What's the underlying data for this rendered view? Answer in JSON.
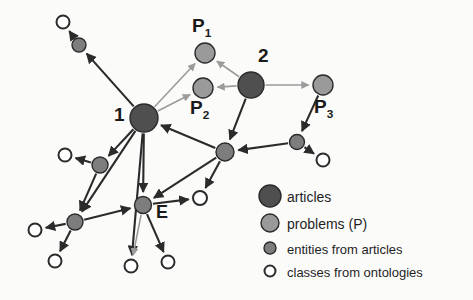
{
  "figure": {
    "type": "node-link-diagram",
    "background_color": "#fbfbfa",
    "edge_color_dark": "#2b2b2b",
    "edge_color_light": "#9b9b9b"
  },
  "palette": {
    "articles": "#4f4f4f",
    "problems": "#9a9a9a",
    "entities": "#7d7d7d",
    "classes": "#ffffff",
    "stroke": "#2b2b2b",
    "text": "#1a1a1a"
  },
  "labels": {
    "node1": "1",
    "node2": "2",
    "p1_base": "P",
    "p1_sub": "1",
    "p2_base": "P",
    "p2_sub": "2",
    "p3_base": "P",
    "p3_sub": "3",
    "entity_e": "E"
  },
  "legend": {
    "items": [
      {
        "label": "articles",
        "kind": "articles",
        "color": "#4f4f4f",
        "radius": 11
      },
      {
        "label": "problems (P)",
        "kind": "problems",
        "color": "#9a9a9a",
        "radius": 9
      },
      {
        "label": "entities from articles",
        "kind": "entities",
        "color": "#7d7d7d",
        "radius": 6
      },
      {
        "label": "classes from ontologies",
        "kind": "classes",
        "color": "#ffffff",
        "radius": 5.5
      }
    ]
  },
  "chart_data": {
    "type": "diagram",
    "title": "",
    "nodes": [
      {
        "id": "c1",
        "kind": "classes",
        "x": 63,
        "y": 22,
        "r": 6.5,
        "label": ""
      },
      {
        "id": "e1",
        "kind": "entities",
        "x": 79,
        "y": 45,
        "r": 7,
        "label": ""
      },
      {
        "id": "a1",
        "kind": "articles",
        "x": 144,
        "y": 118,
        "r": 14,
        "label": "1"
      },
      {
        "id": "p1",
        "kind": "problems",
        "x": 205,
        "y": 53,
        "r": 10,
        "label": "P1"
      },
      {
        "id": "p2",
        "kind": "problems",
        "x": 203,
        "y": 88,
        "r": 10,
        "label": "P2"
      },
      {
        "id": "a2",
        "kind": "articles",
        "x": 251,
        "y": 85,
        "r": 13,
        "label": "2"
      },
      {
        "id": "p3",
        "kind": "problems",
        "x": 323,
        "y": 85,
        "r": 10,
        "label": "P3"
      },
      {
        "id": "e2",
        "kind": "entities",
        "x": 297,
        "y": 142,
        "r": 7.5,
        "label": ""
      },
      {
        "id": "c2",
        "kind": "classes",
        "x": 323,
        "y": 160,
        "r": 6.5,
        "label": ""
      },
      {
        "id": "h1",
        "kind": "entities",
        "x": 225,
        "y": 152,
        "r": 9,
        "label": ""
      },
      {
        "id": "c3",
        "kind": "classes",
        "x": 200,
        "y": 198,
        "r": 7,
        "label": ""
      },
      {
        "id": "e3",
        "kind": "entities",
        "x": 100,
        "y": 165,
        "r": 8,
        "label": ""
      },
      {
        "id": "c4",
        "kind": "classes",
        "x": 65,
        "y": 155,
        "r": 6.5,
        "label": ""
      },
      {
        "id": "eE",
        "kind": "entities",
        "x": 143,
        "y": 205,
        "r": 8.5,
        "label": "E"
      },
      {
        "id": "e4",
        "kind": "entities",
        "x": 75,
        "y": 222,
        "r": 8,
        "label": ""
      },
      {
        "id": "c5",
        "kind": "classes",
        "x": 35,
        "y": 230,
        "r": 6.5,
        "label": ""
      },
      {
        "id": "c6",
        "kind": "classes",
        "x": 55,
        "y": 261,
        "r": 6.5,
        "label": ""
      },
      {
        "id": "c7",
        "kind": "classes",
        "x": 131,
        "y": 266,
        "r": 6.5,
        "label": ""
      },
      {
        "id": "c8",
        "kind": "classes",
        "x": 168,
        "y": 262,
        "r": 6.5,
        "label": ""
      }
    ],
    "edges": [
      {
        "from": "a1",
        "to": "e1",
        "style": "dark"
      },
      {
        "from": "e1",
        "to": "c1",
        "style": "dark"
      },
      {
        "from": "a1",
        "to": "p1",
        "style": "light"
      },
      {
        "from": "a1",
        "to": "p2",
        "style": "light"
      },
      {
        "from": "a2",
        "to": "p1",
        "style": "light"
      },
      {
        "from": "a2",
        "to": "p2",
        "style": "light"
      },
      {
        "from": "a2",
        "to": "p3",
        "style": "light"
      },
      {
        "from": "a2",
        "to": "h1",
        "style": "dark"
      },
      {
        "from": "p3",
        "to": "e2",
        "style": "dark"
      },
      {
        "from": "e2",
        "to": "c2",
        "style": "dark"
      },
      {
        "from": "e2",
        "to": "h1",
        "style": "dark"
      },
      {
        "from": "h1",
        "to": "a1",
        "style": "dark"
      },
      {
        "from": "h1",
        "to": "c3",
        "style": "dark"
      },
      {
        "from": "h1",
        "to": "eE",
        "style": "dark"
      },
      {
        "from": "a1",
        "to": "e3",
        "style": "dark"
      },
      {
        "from": "e3",
        "to": "c4",
        "style": "dark"
      },
      {
        "from": "e3",
        "to": "e4",
        "style": "dark"
      },
      {
        "from": "a1",
        "to": "eE",
        "style": "dark"
      },
      {
        "from": "a1",
        "to": "e4",
        "style": "dark"
      },
      {
        "from": "a1",
        "to": "c7",
        "style": "dark"
      },
      {
        "from": "e4",
        "to": "c5",
        "style": "dark"
      },
      {
        "from": "e4",
        "to": "c6",
        "style": "dark"
      },
      {
        "from": "e4",
        "to": "eE",
        "style": "dark"
      },
      {
        "from": "eE",
        "to": "c3",
        "style": "dark"
      },
      {
        "from": "eE",
        "to": "c7",
        "style": "light"
      },
      {
        "from": "eE",
        "to": "c8",
        "style": "dark"
      }
    ]
  }
}
